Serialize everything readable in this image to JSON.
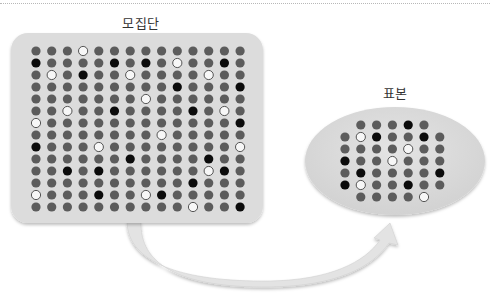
{
  "population": {
    "title": "모집단",
    "rows": [
      "...W..........",
      "B....B.B.W..B.",
      ".W.B..W....W..",
      ".........B...B",
      ".......W......",
      "..W..B....B.W.",
      "W............B",
      "........W.....",
      "B...W........W",
      "......B....B..",
      "..B.B......WB.",
      "..........B...",
      "W...B..WB.....",
      "..........W..B"
    ]
  },
  "sample": {
    "title": "표본",
    "rows": [
      " ...B. ",
      ".WB..B.",
      "....W..",
      "B..W...",
      ".B....B",
      "BW..B..",
      " ....W "
    ]
  },
  "legend_key": {
    ".": "gray",
    "B": "black",
    "W": "white"
  },
  "colors": {
    "gray_dot": "#5c5c5c",
    "black_dot": "#0c0c0c",
    "white_dot": "#f7f7f7",
    "panel_fill": "#dddddd",
    "arrow_fill": "#e2e2e2"
  }
}
